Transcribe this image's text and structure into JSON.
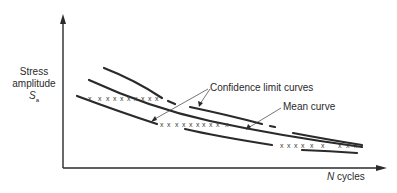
{
  "diagram": {
    "type": "S-N fatigue curve schematic",
    "y_axis": {
      "label_line1": "Stress",
      "label_line2": "amplitude",
      "symbol": "S",
      "subscript": "a"
    },
    "x_axis": {
      "symbol": "N",
      "label": "cycles"
    },
    "annotations": {
      "confidence": "Confidence limit curves",
      "mean": "Mean curve"
    },
    "data_marker": "x",
    "colors": {
      "line": "#2a2a2a",
      "background": "#ffffff"
    }
  }
}
